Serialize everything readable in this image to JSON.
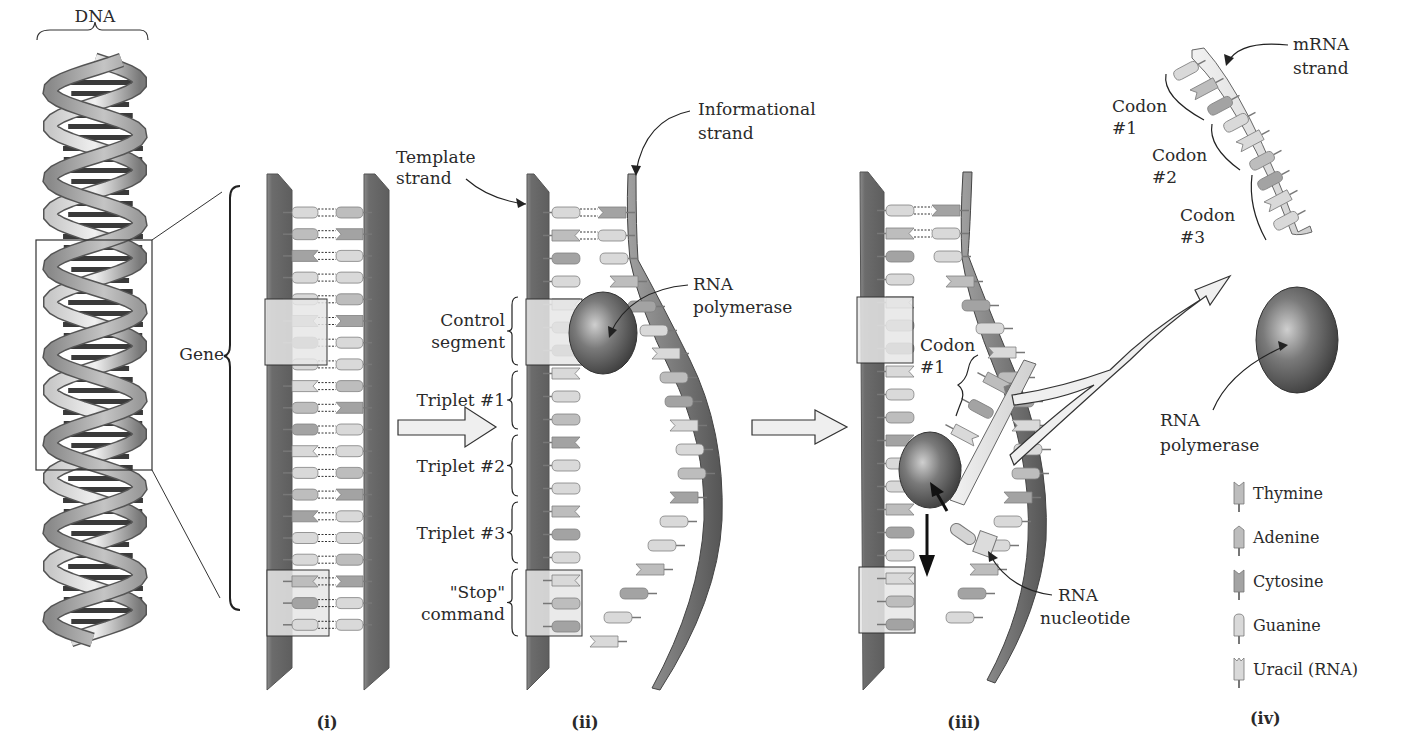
{
  "figure": {
    "colors": {
      "backbone_dark": "#6e6e6e",
      "backbone_light": "#9a9a9a",
      "base_light": "#d9d9d9",
      "base_mid": "#bdbdbd",
      "base_dark": "#a3a3a3",
      "control_box": "#e4e4e4",
      "arrow_fill": "#eeeeee",
      "polymerase": "#6a6a6a",
      "text": "#2a2a2a"
    }
  },
  "dna_helix": {
    "label": "DNA",
    "gene_label": "Gene"
  },
  "panels": [
    {
      "id": "i",
      "label": "(i)"
    },
    {
      "id": "ii",
      "label": "(ii)"
    },
    {
      "id": "iii",
      "label": "(iii)"
    },
    {
      "id": "iv",
      "label": "(iv)"
    }
  ],
  "panel_ii": {
    "template_strand_label": [
      "Template",
      "strand"
    ],
    "informational_strand_label": [
      "Informational",
      "strand"
    ],
    "rna_polymerase_label": [
      "RNA",
      "polymerase"
    ],
    "segments": [
      {
        "name": "control",
        "label": [
          "Control",
          "segment"
        ]
      },
      {
        "name": "triplet-1",
        "label": [
          "Triplet #1"
        ]
      },
      {
        "name": "triplet-2",
        "label": [
          "Triplet #2"
        ]
      },
      {
        "name": "triplet-3",
        "label": [
          "Triplet #3"
        ]
      },
      {
        "name": "stop",
        "label": [
          "\"Stop\"",
          "command"
        ]
      }
    ]
  },
  "panel_iii": {
    "codon_label": [
      "Codon",
      "#1"
    ],
    "rna_nucleotide_label": [
      "RNA",
      "nucleotide"
    ]
  },
  "panel_iv": {
    "mrna_strand_label": [
      "mRNA",
      "strand"
    ],
    "codons": [
      {
        "label": [
          "Codon",
          "#1"
        ]
      },
      {
        "label": [
          "Codon",
          "#2"
        ]
      },
      {
        "label": [
          "Codon",
          "#3"
        ]
      }
    ],
    "rna_polymerase_label": [
      "RNA",
      "polymerase"
    ]
  },
  "legend": [
    {
      "icon": "thymine-icon",
      "label": "Thymine",
      "shape": "notch-v"
    },
    {
      "icon": "adenine-icon",
      "label": "Adenine",
      "shape": "point"
    },
    {
      "icon": "cytosine-icon",
      "label": "Cytosine",
      "shape": "notch-dark"
    },
    {
      "icon": "guanine-icon",
      "label": "Guanine",
      "shape": "round"
    },
    {
      "icon": "uracil-icon",
      "label": "Uracil (RNA)",
      "shape": "notch-m"
    }
  ]
}
